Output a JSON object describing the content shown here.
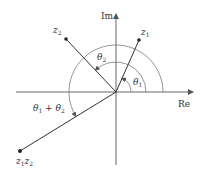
{
  "diagram": {
    "colors": {
      "axis": "#555555",
      "vector": "#333333",
      "arc": "#7a7a7a",
      "point": "#222222",
      "text": "#333333",
      "background": "#ffffff"
    },
    "origin": {
      "x": 116,
      "y": 92
    },
    "axes": {
      "real": {
        "label": "Re",
        "x_start": 16,
        "x_end": 193
      },
      "imag": {
        "label": "Im",
        "y_start": 165,
        "y_end": 14
      }
    },
    "points": [
      {
        "id": "z1",
        "label_main": "z",
        "label_sub": "1",
        "x": 139,
        "y": 40
      },
      {
        "id": "z2",
        "label_main": "z",
        "label_sub": "2",
        "x": 66,
        "y": 39
      },
      {
        "id": "z1z2",
        "label_main": "z",
        "label_sub": "1",
        "label_main2": "z",
        "label_sub2": "2",
        "x": 20,
        "y": 151
      }
    ],
    "angles": [
      {
        "id": "theta1",
        "label_main": "θ",
        "label_sub": "1",
        "radius": 15,
        "end_deg": 66
      },
      {
        "id": "theta2",
        "label_main": "θ",
        "label_sub": "2",
        "radius": 30,
        "end_deg": 133
      },
      {
        "id": "theta1_plus_theta2",
        "label": "θ₁ + θ₂",
        "label_main": "θ",
        "label_sub": "1",
        "label_op": " + ",
        "label_main2": "θ",
        "label_sub2": "2",
        "radius": 47,
        "end_deg": 211
      }
    ]
  }
}
